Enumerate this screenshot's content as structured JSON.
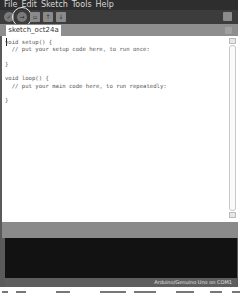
{
  "menubar": {
    "items": [
      {
        "label": "File",
        "accel": "F"
      },
      {
        "label": "Edit",
        "accel": "E"
      },
      {
        "label": "Sketch",
        "accel": "S"
      },
      {
        "label": "Tools",
        "accel": "T"
      },
      {
        "label": "Help",
        "accel": "H"
      }
    ]
  },
  "toolbar": {
    "buttons": [
      {
        "name": "verify",
        "glyph": "✓"
      },
      {
        "name": "upload",
        "glyph": "→"
      },
      {
        "name": "new",
        "glyph": "▫"
      },
      {
        "name": "open",
        "glyph": "↑"
      },
      {
        "name": "save",
        "glyph": "↓"
      }
    ],
    "highlighted": "upload",
    "serial_monitor_glyph": "⌕"
  },
  "tabs": [
    {
      "label": "sketch_oct24a",
      "active": true
    }
  ],
  "editor": {
    "code": "void setup() {\n  // put your setup code here, to run once:\n\n}\n\nvoid loop() {\n  // put your main code here, to run repeatedly:\n\n}"
  },
  "status": {
    "board": "Arduino/Genuino Uno on COM1"
  },
  "colors": {
    "menubar_bg": "#2e2e2e",
    "toolbar_bg": "#3c3c3c",
    "tabbar_bg": "#8e8e8e",
    "console_bg": "#121212",
    "statusbar_bg": "#5e5e5e"
  }
}
